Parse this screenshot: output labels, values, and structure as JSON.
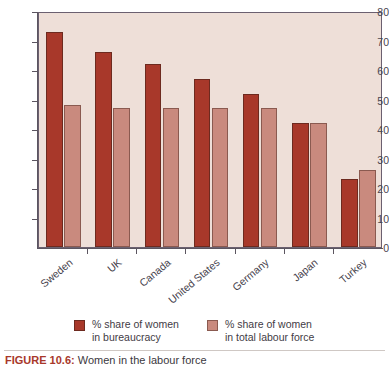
{
  "caption": {
    "label": "FIGURE 10.6:",
    "text": "Women in the labour force"
  },
  "legend": {
    "items": [
      {
        "label_line1": "% share of women",
        "label_line2": "in bureaucracy",
        "color": "#A8382A"
      },
      {
        "label_line1": "% share of women",
        "label_line2": "in total labour force",
        "color": "#C98A7E"
      }
    ]
  },
  "colors": {
    "dark_red": "#A8382A",
    "light_salmon": "#C98A7E",
    "plot_background": "#EEDFD8",
    "frame": "#6b6070",
    "axis_text": "#45414b",
    "caption_accent": "#A8382A"
  },
  "chart_data": {
    "type": "bar",
    "title": "Women in the labour force",
    "xlabel": "",
    "ylabel": "",
    "ylim": [
      0,
      80
    ],
    "yticks": [
      0,
      10,
      20,
      30,
      40,
      50,
      60,
      70,
      80
    ],
    "grid": false,
    "legend_position": "bottom",
    "categories": [
      "Sweden",
      "UK",
      "Canada",
      "United States",
      "Germany",
      "Japan",
      "Turkey"
    ],
    "series": [
      {
        "name": "% share of women in bureaucracy",
        "color": "#A8382A",
        "values": [
          73,
          66,
          62,
          57,
          52,
          42,
          23
        ]
      },
      {
        "name": "% share of women in total labour force",
        "color": "#C98A7E",
        "values": [
          48,
          47,
          47,
          47,
          47,
          42,
          26
        ]
      }
    ]
  }
}
